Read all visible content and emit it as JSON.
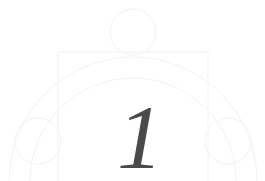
{
  "page": {
    "kind": "chapter-opener-ornament",
    "width": 265,
    "height": 181,
    "background_color": "#ffffff"
  },
  "numeral": {
    "text": "1",
    "color": "#4a4a4a",
    "style": "italic-serif",
    "font_size_px": 92,
    "baseline_y": 168,
    "center_x": 140
  },
  "ornament": {
    "stroke_color": "#f2f2f3",
    "stroke_width": 1,
    "description": "faint geometric construction of arcs, a rectangle and three circles",
    "rectangle": {
      "x": 58,
      "y": 52,
      "width": 150,
      "height": 129,
      "open_bottom": true
    },
    "arcs": [
      {
        "name": "outer-arc",
        "center_x": 133,
        "center_y": 181,
        "radius": 124,
        "start_deg": 180,
        "end_deg": 360
      },
      {
        "name": "inner-arc",
        "center_x": 133,
        "center_y": 181,
        "radius": 103,
        "start_deg": 180,
        "end_deg": 360
      }
    ],
    "circles": [
      {
        "name": "top-circle",
        "cx": 133,
        "cy": 32,
        "r": 23
      },
      {
        "name": "left-circle",
        "cx": 38,
        "cy": 141,
        "r": 23
      },
      {
        "name": "right-circle",
        "cx": 228,
        "cy": 141,
        "r": 23
      }
    ]
  }
}
